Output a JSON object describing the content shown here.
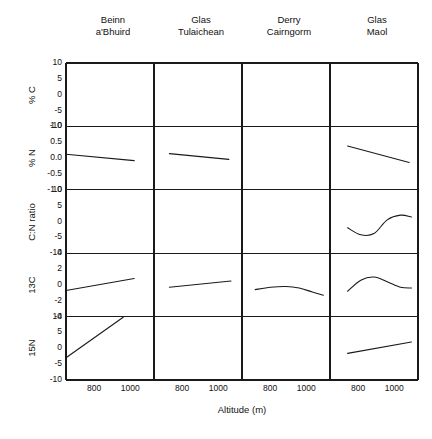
{
  "figure": {
    "xaxis_title": "Altitude (m)",
    "columns": [
      {
        "line1": "Beinn",
        "line2": "a'Bhuird"
      },
      {
        "line1": "Glas",
        "line2": "Tulaichean"
      },
      {
        "line1": "Derry",
        "line2": "Cairngorm"
      },
      {
        "line1": "Glas",
        "line2": "Maol"
      }
    ],
    "xticks": [
      "800",
      "1000"
    ]
  },
  "chart_data": {
    "type": "line",
    "title": "",
    "xlabel": "Altitude (m)",
    "ylabel": "",
    "layout": {
      "rows": 5,
      "cols": 4,
      "grid": false,
      "legend": "none",
      "shared_x": true
    },
    "xlim": [
      700,
      1100
    ],
    "x_ticks": [
      800,
      1000
    ],
    "columns": [
      "Beinn a'Bhuird",
      "Glas Tulaichean",
      "Derry Cairngorm",
      "Glas Maol"
    ],
    "rows": [
      {
        "ylabel": "% C",
        "ylim": [
          -10,
          10
        ],
        "y_ticks": [
          10,
          5,
          0,
          -5,
          -10
        ],
        "y_tick_labels": [
          "10",
          "5",
          "0",
          "-5",
          "-10"
        ],
        "panels": [
          {
            "column": "Beinn a'Bhuird",
            "x": [],
            "y": []
          },
          {
            "column": "Glas Tulaichean",
            "x": [],
            "y": []
          },
          {
            "column": "Derry Cairngorm",
            "x": [],
            "y": []
          },
          {
            "column": "Glas Maol",
            "x": [],
            "y": []
          }
        ]
      },
      {
        "ylabel": "% N",
        "ylim": [
          -1.0,
          1.0
        ],
        "y_ticks": [
          1.0,
          0.5,
          0.0,
          -0.5,
          -1.0
        ],
        "y_tick_labels": [
          "1.0",
          "0.5",
          "0.0",
          "-0.5",
          "-1.0"
        ],
        "panels": [
          {
            "column": "Beinn a'Bhuird",
            "x": [
              700,
              1010
            ],
            "y": [
              0.12,
              -0.08
            ]
          },
          {
            "column": "Glas Tulaichean",
            "x": [
              770,
              1040
            ],
            "y": [
              0.14,
              -0.04
            ]
          },
          {
            "column": "Derry Cairngorm",
            "x": [],
            "y": []
          },
          {
            "column": "Glas Maol",
            "x": [
              780,
              1060
            ],
            "y": [
              0.38,
              -0.14
            ]
          }
        ]
      },
      {
        "ylabel": "C:N ratio",
        "ylim": [
          -10,
          10
        ],
        "y_ticks": [
          10,
          5,
          0,
          -5,
          -10
        ],
        "y_tick_labels": [
          "10",
          "5",
          "0",
          "-5",
          "-10"
        ],
        "panels": [
          {
            "column": "Beinn a'Bhuird",
            "x": [],
            "y": []
          },
          {
            "column": "Glas Tulaichean",
            "x": [],
            "y": []
          },
          {
            "column": "Derry Cairngorm",
            "x": [],
            "y": []
          },
          {
            "column": "Glas Maol",
            "x": [
              780,
              840,
              900,
              960,
              1020,
              1070
            ],
            "y": [
              -2.0,
              -4.2,
              -3.8,
              0.5,
              2.0,
              1.4
            ]
          }
        ]
      },
      {
        "ylabel": "13C",
        "ylim": [
          -4,
          4
        ],
        "y_ticks": [
          4,
          2,
          0,
          -2,
          -4
        ],
        "y_tick_labels": [
          "4",
          "2",
          "0",
          "-2",
          "-4"
        ],
        "panels": [
          {
            "column": "Beinn a'Bhuird",
            "x": [
              700,
              1010
            ],
            "y": [
              -0.7,
              0.8
            ]
          },
          {
            "column": "Glas Tulaichean",
            "x": [
              770,
              1050
            ],
            "y": [
              -0.3,
              0.5
            ]
          },
          {
            "column": "Derry Cairngorm",
            "x": [
              760,
              830,
              900,
              960,
              1020,
              1070
            ],
            "y": [
              -0.6,
              -0.3,
              -0.2,
              -0.4,
              -0.9,
              -1.3
            ]
          },
          {
            "column": "Glas Maol",
            "x": [
              780,
              840,
              900,
              960,
              1020,
              1070
            ],
            "y": [
              -0.8,
              0.6,
              1.0,
              0.4,
              -0.3,
              -0.4
            ]
          }
        ]
      },
      {
        "ylabel": "15N",
        "ylim": [
          -10,
          10
        ],
        "y_ticks": [
          10,
          5,
          0,
          -5,
          -10
        ],
        "y_tick_labels": [
          "10",
          "5",
          "0",
          "-5",
          "-10"
        ],
        "panels": [
          {
            "column": "Beinn a'Bhuird",
            "x": [
              700,
              960
            ],
            "y": [
              -3.0,
              9.8
            ]
          },
          {
            "column": "Glas Tulaichean",
            "x": [],
            "y": []
          },
          {
            "column": "Derry Cairngorm",
            "x": [],
            "y": []
          },
          {
            "column": "Glas Maol",
            "x": [
              780,
              1070
            ],
            "y": [
              -1.6,
              2.0
            ]
          }
        ]
      }
    ]
  }
}
